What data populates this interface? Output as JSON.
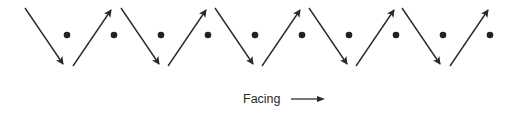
{
  "diagram": {
    "type": "zigzag-movement-pattern",
    "stroke_color": "#2a2a2a",
    "dot_color": "#222222",
    "dot_y": 35,
    "dots_x": [
      67,
      114,
      161,
      208,
      255,
      302,
      349,
      396,
      443,
      490
    ],
    "arrows": [
      {
        "direction": "down",
        "x1": 25,
        "y1": 8,
        "x2": 63,
        "y2": 64
      },
      {
        "direction": "up",
        "x1": 73,
        "y1": 66,
        "x2": 111,
        "y2": 10
      },
      {
        "direction": "down",
        "x1": 121,
        "y1": 8,
        "x2": 159,
        "y2": 64
      },
      {
        "direction": "up",
        "x1": 168,
        "y1": 66,
        "x2": 206,
        "y2": 10
      },
      {
        "direction": "down",
        "x1": 215,
        "y1": 8,
        "x2": 253,
        "y2": 64
      },
      {
        "direction": "up",
        "x1": 262,
        "y1": 66,
        "x2": 300,
        "y2": 10
      },
      {
        "direction": "down",
        "x1": 309,
        "y1": 8,
        "x2": 347,
        "y2": 64
      },
      {
        "direction": "up",
        "x1": 356,
        "y1": 66,
        "x2": 394,
        "y2": 10
      },
      {
        "direction": "down",
        "x1": 402,
        "y1": 8,
        "x2": 440,
        "y2": 64
      },
      {
        "direction": "up",
        "x1": 450,
        "y1": 66,
        "x2": 488,
        "y2": 10
      }
    ]
  },
  "caption": {
    "label": "Facing",
    "arrow_icon": "right-arrow-icon"
  }
}
